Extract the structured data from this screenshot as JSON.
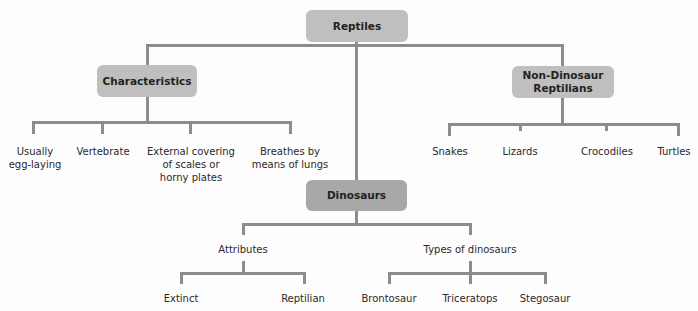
{
  "diagram": {
    "root": {
      "label": "Reptiles"
    },
    "characteristics": {
      "label": "Characteristics",
      "children": [
        "Usually\negg-laying",
        "Vertebrate",
        "External covering\nof scales or\nhorny plates",
        "Breathes by\nmeans of lungs"
      ]
    },
    "non_dinosaur": {
      "label": "Non-Dinosaur\nReptilians",
      "children": [
        "Snakes",
        "Lizards",
        "Crocodiles",
        "Turtles"
      ]
    },
    "dinosaurs": {
      "label": "Dinosaurs",
      "attributes": {
        "label": "Attributes",
        "children": [
          "Extinct",
          "Reptilian"
        ]
      },
      "types": {
        "label": "Types of dinosaurs",
        "children": [
          "Brontosaur",
          "Triceratops",
          "Stegosaur"
        ]
      }
    }
  },
  "colors": {
    "box": "#bfbfbf",
    "box_dark": "#a8a8a8",
    "line": "#8c8c8c",
    "text": "#222222"
  }
}
